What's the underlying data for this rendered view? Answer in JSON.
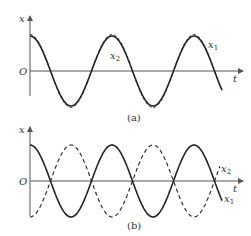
{
  "figure": {
    "panels": [
      {
        "id": "a",
        "caption": "(a)",
        "y_axis_label": "x",
        "x_axis_label": "t",
        "origin_label": "O",
        "curve_labels": [
          {
            "base": "x",
            "sub": "1"
          },
          {
            "base": "x",
            "sub": "2"
          }
        ],
        "description": "x1 (solid) and x2 (dashed) in phase, nearly coincident cosine curves"
      },
      {
        "id": "b",
        "caption": "(b)",
        "y_axis_label": "x",
        "x_axis_label": "t",
        "origin_label": "O",
        "curve_labels": [
          {
            "base": "x",
            "sub": "2"
          },
          {
            "base": "x",
            "sub": "1"
          }
        ],
        "description": "x1 (solid) and x2 (dashed) in antiphase"
      }
    ]
  },
  "colors": {
    "line": "#222222",
    "axis": "#555555",
    "text": "#333333"
  }
}
